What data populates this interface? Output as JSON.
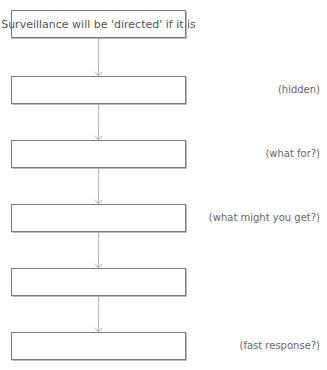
{
  "flowchart": {
    "boxes": [
      {
        "text": "Surveillance will be 'directed' if it is",
        "top": 10
      },
      {
        "text": "",
        "top": 76
      },
      {
        "text": "",
        "top": 140
      },
      {
        "text": "",
        "top": 204
      },
      {
        "text": "",
        "top": 268
      },
      {
        "text": "",
        "top": 332
      }
    ],
    "side_labels": [
      {
        "text": "(hidden)",
        "box_index": 1
      },
      {
        "text": "(what for?)",
        "box_index": 2
      },
      {
        "text": "(what might you get?)",
        "box_index": 3
      },
      {
        "text": "(fast response?)",
        "box_index": 5
      }
    ],
    "colors": {
      "border": "#7a7a7a",
      "arrow": "#b5b5b5",
      "text": "#555555"
    }
  }
}
